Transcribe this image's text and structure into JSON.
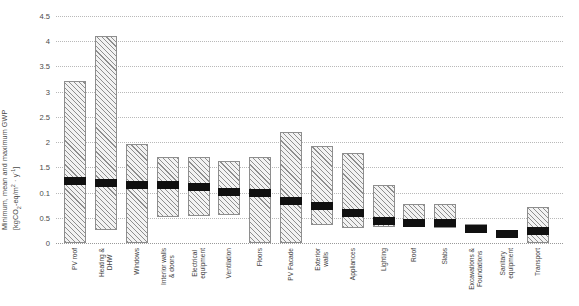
{
  "chart_data": {
    "type": "bar",
    "title": "",
    "subtitle": "",
    "xlabel": "",
    "ylabel_lines": [
      "Minimum, mean and maximum GWP",
      "[kgCO2-eq/m2 · y-1]"
    ],
    "ylabel_plain": "Minimum, mean and maximum GWP [kgCO2-eq/m2 · y-1]",
    "ylim": [
      0,
      4.5
    ],
    "ytick_labels": [
      "4.5",
      "4",
      "3.5",
      "3",
      "2.5",
      "2",
      "1.5",
      "0.1",
      "0.5",
      "0"
    ],
    "ytick_values": [
      4.5,
      4.0,
      3.5,
      3.0,
      2.5,
      2.0,
      1.5,
      1.0,
      0.5,
      0.0
    ],
    "grid": true,
    "grid_style": "dotted-horizontal",
    "legend": "none",
    "bar_style": "diagonal-hatch range bar with solid black mean band",
    "colors": {
      "hatch": "#8e8e8e",
      "bar_fill": "#f2f2f2",
      "bar_edge": "#8e8e8e",
      "mean_band": "#101010",
      "gridline": "#b9b9b9",
      "text": "#3f3f3f"
    },
    "categories": [
      "PV roof",
      "Heating & DHW",
      "Windows",
      "Interior walls & doors",
      "Electrical equipment",
      "Ventilation",
      "Floors",
      "PV Facade",
      "Exterior walls",
      "Appliances",
      "Lighting",
      "Roof",
      "Slabs",
      "Excavations & Foundations",
      "Sanitary equipment",
      "Transport"
    ],
    "category_label_lines": [
      [
        "PV roof"
      ],
      [
        "Heating &",
        "DHW"
      ],
      [
        "Windows"
      ],
      [
        "Interior walls",
        "& doors"
      ],
      [
        "Electrical",
        "equipment"
      ],
      [
        "Ventilation"
      ],
      [
        "Floors"
      ],
      [
        "PV Facade"
      ],
      [
        "Exterior",
        "walls"
      ],
      [
        "Appliances"
      ],
      [
        "Lighting"
      ],
      [
        "Roof"
      ],
      [
        "Slabs"
      ],
      [
        "Excavations &",
        "Foundations"
      ],
      [
        "Sanitary",
        "equipment"
      ],
      [
        "Transport"
      ]
    ],
    "series": [
      {
        "name": "minimum",
        "values": [
          0.0,
          0.26,
          0.0,
          0.52,
          0.54,
          0.56,
          0.0,
          0.0,
          0.36,
          0.3,
          0.32,
          0.34,
          0.3,
          0.22,
          0.14,
          0.0
        ]
      },
      {
        "name": "mean",
        "values": [
          1.22,
          1.18,
          1.14,
          1.14,
          1.12,
          1.02,
          1.0,
          0.84,
          0.74,
          0.6,
          0.44,
          0.4,
          0.4,
          0.28,
          0.18,
          0.24
        ]
      },
      {
        "name": "maximum",
        "values": [
          3.22,
          4.1,
          1.96,
          1.7,
          1.7,
          1.62,
          1.7,
          2.2,
          1.92,
          1.78,
          1.14,
          0.78,
          0.78,
          0.38,
          0.22,
          0.72
        ]
      }
    ]
  }
}
